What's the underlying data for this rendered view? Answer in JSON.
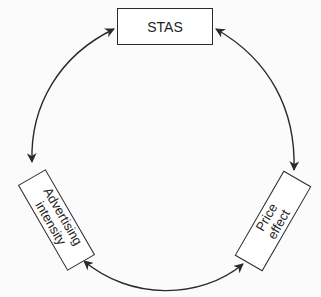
{
  "diagram": {
    "type": "cycle",
    "nodes": [
      {
        "id": "stas",
        "label": "STAS"
      },
      {
        "id": "advertising",
        "label_line1": "Advertising",
        "label_line2": "intensity"
      },
      {
        "id": "price",
        "label_line1": "Price",
        "label_line2": "effect"
      }
    ],
    "edges": [
      {
        "from": "stas",
        "to": "advertising",
        "direction": "bidirectional"
      },
      {
        "from": "stas",
        "to": "price",
        "direction": "bidirectional"
      },
      {
        "from": "advertising",
        "to": "price",
        "direction": "bidirectional"
      }
    ],
    "colors": {
      "stroke": "#2a2a2a",
      "background": "#fbfbfb"
    }
  }
}
